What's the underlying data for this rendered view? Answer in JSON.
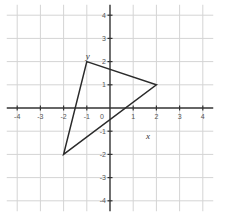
{
  "chart_data": {
    "type": "scatter",
    "title": "",
    "xlabel": "x",
    "ylabel": "y",
    "xlim": [
      -4,
      4
    ],
    "ylim": [
      -4,
      4
    ],
    "grid": true,
    "x_ticks": [
      -4,
      -3,
      -2,
      -1,
      0,
      1,
      2,
      3,
      4
    ],
    "y_ticks": [
      4,
      3,
      2,
      1,
      -1,
      -2,
      -3,
      -4
    ],
    "x_tick_labels": [
      "-4",
      "-3",
      "-2",
      "-1",
      "0",
      "1",
      "2",
      "3",
      "4"
    ],
    "y_tick_labels": [
      "4",
      "3",
      "2",
      "1",
      "-1",
      "-2",
      "-3",
      "-4"
    ],
    "series": [
      {
        "name": "triangle",
        "shape": "polygon",
        "points": [
          [
            -1,
            2
          ],
          [
            2,
            1
          ],
          [
            -2,
            -2
          ]
        ]
      }
    ]
  },
  "colors": {
    "grid": "#d4d4d4",
    "axis": "#333333",
    "shape": "#2a2a2a",
    "background": "#ffffff"
  }
}
